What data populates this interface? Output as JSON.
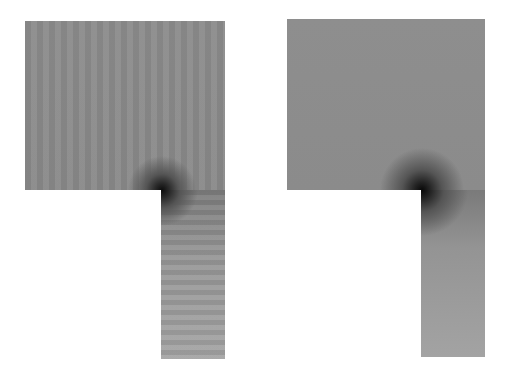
{
  "figure": {
    "panels": [
      {
        "id": "left",
        "description": "L-shaped domain field map with oscillatory fringes and dark singularity at re-entrant corner",
        "colors": {
          "field": "#8c8c8c",
          "singularity": "#0c0c0c",
          "leg_bottom": "#a5a5a5"
        }
      },
      {
        "id": "right",
        "description": "L-shaped domain field map, smooth, dark singularity at re-entrant corner",
        "colors": {
          "field": "#8d8d8d",
          "singularity": "#080808",
          "leg_bottom": "#a3a3a3"
        }
      }
    ],
    "background": "#ffffff"
  }
}
